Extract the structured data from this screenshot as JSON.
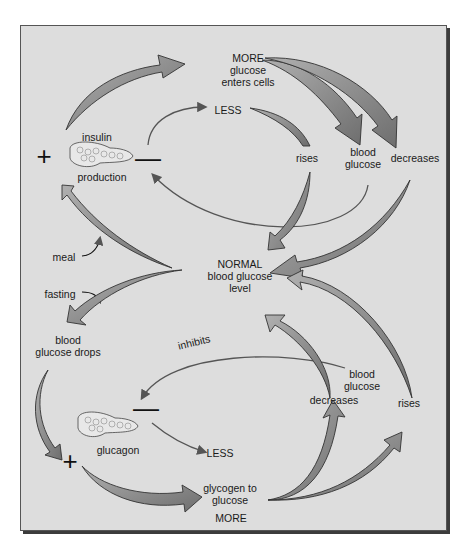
{
  "diagram": {
    "colors": {
      "panel_bg": "#dddddd",
      "arrow_fill": "#8a8a8a",
      "arrow_stroke": "#333333",
      "thin_line": "#555555",
      "text": "#1a1a1a"
    },
    "center": {
      "line1": "NORMAL",
      "line2": "blood glucose",
      "line3": "level"
    },
    "top_loop": {
      "gland_label": "insulin",
      "gland_sublabel": "production",
      "plus_sign": "+",
      "minus_sign": "—",
      "more_line1": "MORE",
      "more_line2": "glucose",
      "more_line3": "enters cells",
      "less": "LESS",
      "rises": "rises",
      "blood_glucose_line1": "blood",
      "blood_glucose_line2": "glucose",
      "decreases": "decreases",
      "trigger": "meal"
    },
    "bottom_loop": {
      "trigger": "fasting",
      "drops_line1": "blood",
      "drops_line2": "glucose drops",
      "inhibits": "inhibits",
      "gland_label": "glucagon",
      "plus_sign": "+",
      "minus_sign": "—",
      "less": "LESS",
      "glycogen_line1": "glycogen to",
      "glycogen_line2": "glucose",
      "more": "MORE",
      "decreases": "decreases",
      "blood_glucose_line1": "blood",
      "blood_glucose_line2": "glucose",
      "rises": "rises"
    }
  }
}
